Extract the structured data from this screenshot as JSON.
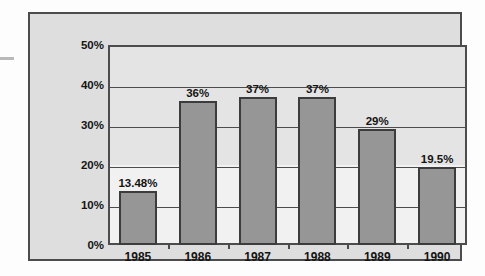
{
  "chart_data": {
    "type": "bar",
    "title": "",
    "subtitle": "",
    "xlabel": "",
    "ylabel": "",
    "categories": [
      "1985",
      "1986",
      "1987",
      "1988",
      "1989",
      "1990"
    ],
    "values": [
      13.48,
      36,
      37,
      37,
      29,
      19.5
    ],
    "value_labels": [
      "13.48%",
      "36%",
      "37%",
      "37%",
      "29%",
      "19.5%"
    ],
    "series": [
      {
        "name": "",
        "values": [
          13.48,
          36,
          37,
          37,
          29,
          19.5
        ]
      }
    ],
    "ylim": [
      0,
      50
    ],
    "ytick_values": [
      0,
      10,
      20,
      30,
      40,
      50
    ],
    "ytick_labels": [
      "0%",
      "10%",
      "20%",
      "30%",
      "40%",
      "50%"
    ],
    "grid": true,
    "grid_axis": "y",
    "legend": false,
    "legend_position": "none",
    "annotations": [],
    "colors": {
      "bar_fill": "#969696",
      "bar_edge": "#3c3c3c",
      "plot_background": "#e4e4e4",
      "plot_background_lower": "#f1f1f1",
      "figure_background": "#dedede",
      "axis": "#4c4c4c",
      "text": "#141414"
    }
  }
}
